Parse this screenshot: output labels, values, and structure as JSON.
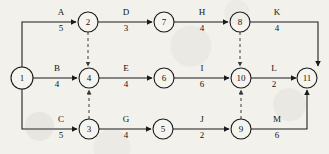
{
  "diagram": {
    "type": "aoa-network",
    "width": 329,
    "height": 154,
    "colors": {
      "background": "#f3f1ec",
      "line": "#1a1a1a",
      "dummy": "#3a3a3a",
      "text": "#111111",
      "node_fill": "#f6f4ef"
    },
    "nodes": [
      {
        "id": "1",
        "label": "1",
        "cx": 22,
        "cy": 78,
        "r": 11
      },
      {
        "id": "2",
        "label": "2",
        "cx": 88,
        "cy": 22,
        "r": 10
      },
      {
        "id": "3",
        "label": "3",
        "cx": 89,
        "cy": 129,
        "r": 10
      },
      {
        "id": "4",
        "label": "4",
        "cx": 89,
        "cy": 78,
        "r": 10
      },
      {
        "id": "5",
        "label": "5",
        "cx": 163,
        "cy": 129,
        "r": 10
      },
      {
        "id": "6",
        "label": "6",
        "cx": 164,
        "cy": 78,
        "r": 10
      },
      {
        "id": "7",
        "label": "7",
        "cx": 164,
        "cy": 22,
        "r": 10
      },
      {
        "id": "8",
        "label": "8",
        "cx": 240,
        "cy": 22,
        "r": 10
      },
      {
        "id": "9",
        "label": "9",
        "cx": 241,
        "cy": 129,
        "r": 10
      },
      {
        "id": "10",
        "label": "10",
        "cx": 241,
        "cy": 78,
        "r": 10
      },
      {
        "id": "11",
        "label": "11",
        "cx": 307,
        "cy": 78,
        "r": 10
      }
    ],
    "activities": [
      {
        "name": "A",
        "duration": "5",
        "from": "1",
        "to": "2",
        "label_x": 61,
        "name_y": 15,
        "dur_y": 31
      },
      {
        "name": "B",
        "duration": "4",
        "from": "1",
        "to": "4",
        "label_x": 57,
        "name_y": 71,
        "dur_y": 87
      },
      {
        "name": "C",
        "duration": "5",
        "from": "1",
        "to": "3",
        "label_x": 61,
        "name_y": 122,
        "dur_y": 138
      },
      {
        "name": "D",
        "duration": "3",
        "from": "2",
        "to": "7",
        "label_x": 126,
        "name_y": 15,
        "dur_y": 31
      },
      {
        "name": "E",
        "duration": "4",
        "from": "4",
        "to": "6",
        "label_x": 126,
        "name_y": 71,
        "dur_y": 87
      },
      {
        "name": "G",
        "duration": "4",
        "from": "3",
        "to": "5",
        "label_x": 126,
        "name_y": 122,
        "dur_y": 138
      },
      {
        "name": "H",
        "duration": "4",
        "from": "7",
        "to": "8",
        "label_x": 202,
        "name_y": 15,
        "dur_y": 31
      },
      {
        "name": "I",
        "duration": "6",
        "from": "6",
        "to": "10",
        "label_x": 202,
        "name_y": 71,
        "dur_y": 87
      },
      {
        "name": "J",
        "duration": "2",
        "from": "5",
        "to": "9",
        "label_x": 202,
        "name_y": 122,
        "dur_y": 138
      },
      {
        "name": "K",
        "duration": "4",
        "from": "8",
        "to": "11",
        "label_x": 277,
        "name_y": 15,
        "dur_y": 31
      },
      {
        "name": "L",
        "duration": "2",
        "from": "10",
        "to": "11",
        "label_x": 274,
        "name_y": 71,
        "dur_y": 87
      },
      {
        "name": "M",
        "duration": "6",
        "from": "9",
        "to": "11",
        "label_x": 277,
        "name_y": 122,
        "dur_y": 138
      }
    ],
    "dummies": [
      {
        "from": "2",
        "to": "4",
        "style": "dashed"
      },
      {
        "from": "3",
        "to": "4",
        "style": "dashed"
      },
      {
        "from": "8",
        "to": "10",
        "style": "dashed"
      },
      {
        "from": "9",
        "to": "10",
        "style": "dashed"
      }
    ]
  }
}
